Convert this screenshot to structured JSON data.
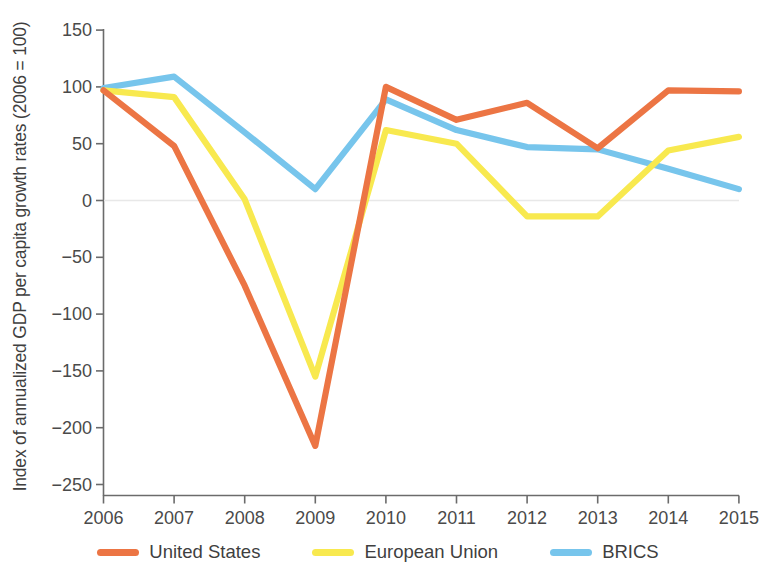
{
  "chart_data": {
    "type": "line",
    "title": "",
    "xlabel": "",
    "ylabel": "Index of annualized GDP per capita growth rates (2006 = 100)",
    "categories": [
      "2006",
      "2007",
      "2008",
      "2009",
      "2010",
      "2011",
      "2012",
      "2013",
      "2014",
      "2015"
    ],
    "x": [
      2006,
      2007,
      2008,
      2009,
      2010,
      2011,
      2012,
      2013,
      2014,
      2015
    ],
    "xlim": [
      2006,
      2015
    ],
    "ylim": [
      -250,
      150
    ],
    "yticks": [
      150,
      100,
      50,
      0,
      -50,
      -100,
      -150,
      -200,
      -250
    ],
    "ytick_labels": [
      "150",
      "100",
      "50",
      "0",
      "−50",
      "−100",
      "−150",
      "−200",
      "−250"
    ],
    "grid": false,
    "zero_line": true,
    "legend_position": "bottom",
    "series": [
      {
        "name": "United States",
        "color": "#ec7544",
        "values": [
          97,
          48,
          -75,
          -216,
          100,
          71,
          86,
          46,
          97,
          96
        ]
      },
      {
        "name": "European Union",
        "color": "#f8e94f",
        "values": [
          97,
          91,
          1,
          -155,
          62,
          50,
          -14,
          -14,
          44,
          56
        ]
      },
      {
        "name": "BRICS",
        "color": "#77c5ec",
        "values": [
          99,
          109,
          60,
          10,
          89,
          62,
          47,
          45,
          28,
          10
        ]
      }
    ]
  },
  "axes": {
    "y_axis_label": "Index of annualized GDP per capita growth rates (2006 = 100)",
    "y_tick_labels": [
      "150",
      "100",
      "50",
      "0",
      "−50",
      "−100",
      "−150",
      "−200",
      "−250"
    ],
    "x_tick_labels": [
      "2006",
      "2007",
      "2008",
      "2009",
      "2010",
      "2011",
      "2012",
      "2013",
      "2014",
      "2015"
    ]
  },
  "legend": {
    "items": [
      {
        "label": "United States",
        "color": "#ec7544"
      },
      {
        "label": "European Union",
        "color": "#f8e94f"
      },
      {
        "label": "BRICS",
        "color": "#77c5ec"
      }
    ]
  },
  "colors": {
    "united_states": "#ec7544",
    "european_union": "#f8e94f",
    "brics": "#77c5ec",
    "axis": "#6b6b6b",
    "text": "#3f3f3f",
    "background": "#ffffff"
  }
}
